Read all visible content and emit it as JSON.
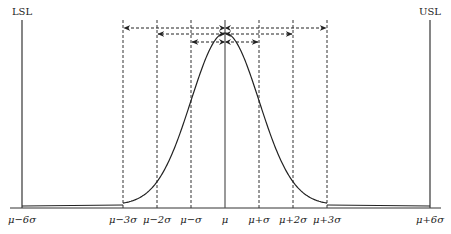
{
  "diagram": {
    "spec_limits": {
      "lower": {
        "label": "LSL",
        "position": "μ−6σ"
      },
      "upper": {
        "label": "USL",
        "position": "μ+6σ"
      }
    },
    "x_ticks": [
      {
        "label": "μ−6σ",
        "k": -6
      },
      {
        "label": "μ−3σ",
        "k": -3
      },
      {
        "label": "μ−2σ",
        "k": -2
      },
      {
        "label": "μ−σ",
        "k": -1
      },
      {
        "label": "μ",
        "k": 0
      },
      {
        "label": "μ+σ",
        "k": 1
      },
      {
        "label": "μ+2σ",
        "k": 2
      },
      {
        "label": "μ+3σ",
        "k": 3
      },
      {
        "label": "μ+6σ",
        "k": 6
      }
    ],
    "intervals": [
      {
        "name": "±3σ",
        "from": -3,
        "to": 3
      },
      {
        "name": "±2σ",
        "from": -2,
        "to": 2
      },
      {
        "name": "±1σ",
        "from": -1,
        "to": 1
      }
    ],
    "curve": "normal bell curve centered at μ",
    "colors": {
      "line": "#222222",
      "background": "#ffffff"
    }
  }
}
